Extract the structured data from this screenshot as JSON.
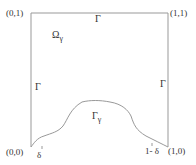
{
  "diagram": {
    "corners": {
      "top_left": "(0,1)",
      "top_right": "(1,1)",
      "bottom_left": "(0,0)",
      "bottom_right": "(1,0)"
    },
    "region_label": {
      "main": "Ω",
      "sub": "γ"
    },
    "boundary_labels": {
      "top": "Γ",
      "left": "Γ",
      "right": "Γ"
    },
    "curve_label": {
      "main": "Γ",
      "sub": "γ"
    },
    "ticks": {
      "left": "δ",
      "right": "1- δ"
    },
    "colors": {
      "line": "#999999",
      "text": "#333333",
      "background": "#ffffff"
    }
  }
}
